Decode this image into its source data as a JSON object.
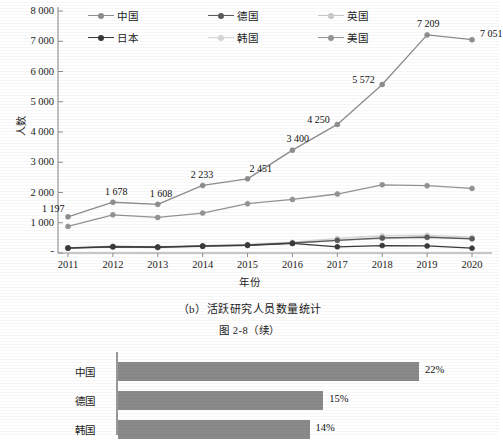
{
  "chart_data": [
    {
      "type": "line",
      "title": "",
      "xlabel": "年份",
      "ylabel": "人数",
      "ylim": [
        0,
        8000
      ],
      "ytick_labels": [
        "8 000",
        "7 000",
        "6 000",
        "5 000",
        "4 000",
        "3 000",
        "2 000",
        "1 000",
        "-"
      ],
      "ytick_values": [
        8000,
        7000,
        6000,
        5000,
        4000,
        3000,
        2000,
        1000,
        0
      ],
      "grid": false,
      "legend_position": "top",
      "categories": [
        "2011",
        "2012",
        "2013",
        "2014",
        "2015",
        "2016",
        "2017",
        "2018",
        "2019",
        "2020"
      ],
      "series": [
        {
          "name": "中国",
          "color": "#8d8d8d",
          "values": [
            1197,
            1678,
            1608,
            2233,
            2451,
            3400,
            4250,
            5572,
            7209,
            7051
          ],
          "data_labels": [
            "1 197",
            "1 678",
            "1 608",
            "2 233",
            "2 451",
            "3 400",
            "4 250",
            "5 572",
            "7 209",
            "7 051"
          ]
        },
        {
          "name": "德国",
          "color": "#5b5b5b",
          "values": [
            170,
            215,
            200,
            235,
            265,
            330,
            420,
            500,
            520,
            470
          ],
          "data_labels": []
        },
        {
          "name": "英国",
          "color": "#c9c9c9",
          "values": [
            155,
            195,
            175,
            215,
            250,
            320,
            415,
            480,
            530,
            480
          ],
          "data_labels": []
        },
        {
          "name": "日本",
          "color": "#3a3a3a",
          "values": [
            160,
            205,
            190,
            225,
            255,
            315,
            205,
            245,
            235,
            160
          ],
          "data_labels": []
        },
        {
          "name": "韩国",
          "color": "#d6d6d6",
          "values": [
            165,
            200,
            185,
            240,
            285,
            355,
            480,
            570,
            590,
            520
          ],
          "data_labels": []
        },
        {
          "name": "美国",
          "color": "#949494",
          "values": [
            880,
            1262,
            1175,
            1320,
            1630,
            1770,
            1950,
            2255,
            2225,
            2135
          ],
          "data_labels": []
        }
      ]
    },
    {
      "type": "bar",
      "orientation": "horizontal",
      "categories": [
        "中国",
        "德国",
        "韩国"
      ],
      "values": [
        22,
        15,
        14
      ],
      "value_labels": [
        "22%",
        "15%",
        "14%"
      ],
      "title": "",
      "xlabel": "",
      "ylabel": "",
      "xlim": [
        0,
        25
      ],
      "grid": false,
      "bar_color": "#8a8a8a"
    }
  ],
  "legend": {
    "items": [
      {
        "label": "中国",
        "color": "#8d8d8d"
      },
      {
        "label": "德国",
        "color": "#5b5b5b"
      },
      {
        "label": "英国",
        "color": "#c9c9c9"
      },
      {
        "label": "日本",
        "color": "#3a3a3a"
      },
      {
        "label": "韩国",
        "color": "#d6d6d6"
      },
      {
        "label": "美国",
        "color": "#949494"
      }
    ]
  },
  "captions": {
    "subfigure": "（b）活跃研究人员数量统计",
    "figure_number": "图 2-8（续）"
  }
}
